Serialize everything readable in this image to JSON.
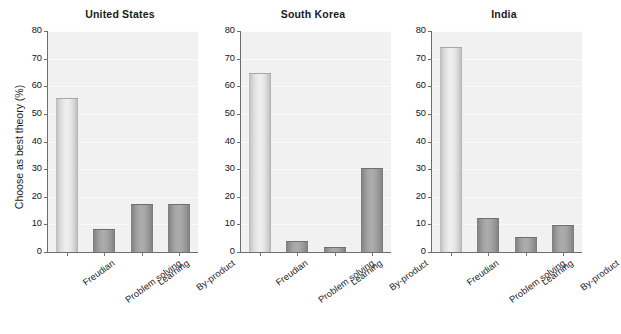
{
  "chart_data": {
    "type": "bar",
    "title": "",
    "xlabel": "",
    "ylabel": "Choose as best theory (%)",
    "ylim": [
      0,
      80
    ],
    "yticks": [
      0,
      10,
      20,
      30,
      40,
      50,
      60,
      70,
      80
    ],
    "grid": true,
    "legend": "none",
    "categories": [
      "Freudian",
      "Problem solving",
      "Learning",
      "By-product"
    ],
    "panels": [
      {
        "title": "United States",
        "values": [
          55.5,
          8,
          17,
          17
        ],
        "bar_styles": [
          "light",
          "dark",
          "dark",
          "dark"
        ]
      },
      {
        "title": "South Korea",
        "values": [
          64.5,
          3.5,
          1.5,
          30
        ],
        "bar_styles": [
          "light",
          "dark",
          "dark",
          "dark"
        ]
      },
      {
        "title": "India",
        "values": [
          74,
          12,
          5,
          9.5
        ],
        "bar_styles": [
          "light",
          "dark",
          "dark",
          "dark"
        ]
      }
    ],
    "colors": {
      "light_bar": "#e2e2e2",
      "dark_bar": "#9e9e9e",
      "plot_background": "#f1f1f1",
      "gridline": "#fbfbfb",
      "axis": "#6d6d6d",
      "text": "#1a1a1a"
    }
  },
  "axis": {
    "tick_0": "0",
    "tick_10": "10",
    "tick_20": "20",
    "tick_30": "30",
    "tick_40": "40",
    "tick_50": "50",
    "tick_60": "60",
    "tick_70": "70",
    "tick_80": "80"
  }
}
